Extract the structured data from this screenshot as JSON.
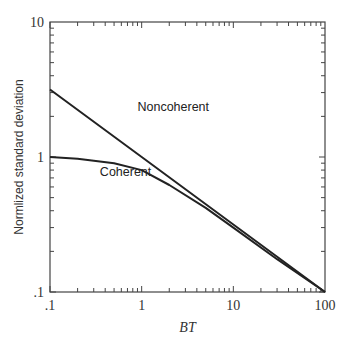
{
  "chart_data": {
    "type": "line",
    "title": "",
    "xlabel": "BT",
    "ylabel": "Normlized standard deviation",
    "xscale": "log",
    "yscale": "log",
    "xlim": [
      0.1,
      100
    ],
    "ylim": [
      0.1,
      10
    ],
    "xticks": [
      ".1",
      "1",
      "10",
      "100"
    ],
    "yticks": [
      ".1",
      "1",
      "10"
    ],
    "grid": false,
    "legend": "inline labels",
    "series": [
      {
        "name": "Noncoherent",
        "x": [
          0.1,
          1,
          10,
          100
        ],
        "y": [
          3.16,
          1.0,
          0.316,
          0.1
        ]
      },
      {
        "name": "Coherent",
        "x": [
          0.1,
          0.2,
          0.5,
          1,
          2,
          5,
          10,
          30,
          100
        ],
        "y": [
          1.0,
          0.97,
          0.9,
          0.8,
          0.62,
          0.42,
          0.3,
          0.175,
          0.1
        ]
      }
    ],
    "annotations": [
      {
        "text": "Noncoherent",
        "x": 0.9,
        "y": 2.2
      },
      {
        "text": "Coherent",
        "x": 0.35,
        "y": 0.72
      }
    ]
  }
}
